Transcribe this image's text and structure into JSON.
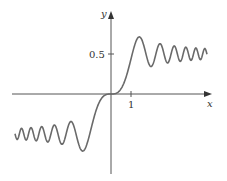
{
  "chart_data": {
    "type": "line",
    "title": "",
    "xlabel": "x",
    "ylabel": "y",
    "x_ticks": [
      {
        "value": 1,
        "label": "1"
      }
    ],
    "y_ticks": [
      {
        "value": 0.5,
        "label": "0.5"
      }
    ],
    "xlim": [
      -4.8,
      4.8
    ],
    "ylim": [
      -0.8,
      0.9
    ],
    "grid": false,
    "legend": null,
    "series": [
      {
        "name": "S(x) = ∫₀ˣ sin(πt²/2) dt",
        "x": [
          -4.8,
          -4.5,
          -4.2,
          -4.0,
          -3.8,
          -3.5,
          -3.2,
          -3.0,
          -2.8,
          -2.5,
          -2.2,
          -2.0,
          -1.8,
          -1.5,
          -1.2,
          -1.0,
          -0.8,
          -0.5,
          -0.2,
          0,
          0.2,
          0.5,
          0.8,
          1.0,
          1.2,
          1.5,
          1.8,
          2.0,
          2.2,
          2.5,
          2.8,
          3.0,
          3.2,
          3.5,
          3.8,
          4.0,
          4.2,
          4.5,
          4.8
        ],
        "values": [
          -0.43,
          -0.43,
          -0.56,
          -0.42,
          -0.56,
          -0.42,
          -0.59,
          -0.5,
          -0.39,
          -0.62,
          -0.46,
          -0.34,
          -0.45,
          -0.7,
          -0.62,
          -0.44,
          -0.25,
          -0.06,
          0.0,
          0.0,
          0.0,
          0.06,
          0.25,
          0.44,
          0.62,
          0.7,
          0.45,
          0.34,
          0.46,
          0.62,
          0.39,
          0.5,
          0.59,
          0.42,
          0.56,
          0.42,
          0.56,
          0.43,
          0.43
        ]
      }
    ],
    "colors": {
      "curve": "#6a6a6a",
      "axis": "#555555"
    }
  },
  "axes": {
    "x_label": "x",
    "y_label": "y",
    "x_tick_label": "1",
    "y_tick_label": "0.5"
  }
}
